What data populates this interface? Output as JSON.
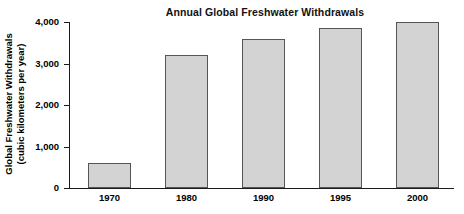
{
  "chart_data": {
    "type": "bar",
    "title": "Annual Global Freshwater Withdrawals",
    "xlabel": "",
    "ylabel": "Global Freshwater Withdrawals (cubic kilometers per year)",
    "ylabel_lines": [
      "Global Freshwater Withdrawals",
      "(cubic kilometers per year)"
    ],
    "categories": [
      "1970",
      "1980",
      "1990",
      "1995",
      "2000"
    ],
    "values": [
      600,
      3200,
      3600,
      3850,
      4000
    ],
    "ylim": [
      0,
      4000
    ],
    "yticks": [
      0,
      1000,
      2000,
      3000,
      4000
    ],
    "ytick_labels": [
      "0",
      "1,000",
      "2,000",
      "3,000",
      "4,000"
    ],
    "grid": false,
    "legend": "none",
    "bar_color": "#d3d3d3",
    "bar_border_color": "#555555",
    "axis_color": "#1a1a1a"
  }
}
